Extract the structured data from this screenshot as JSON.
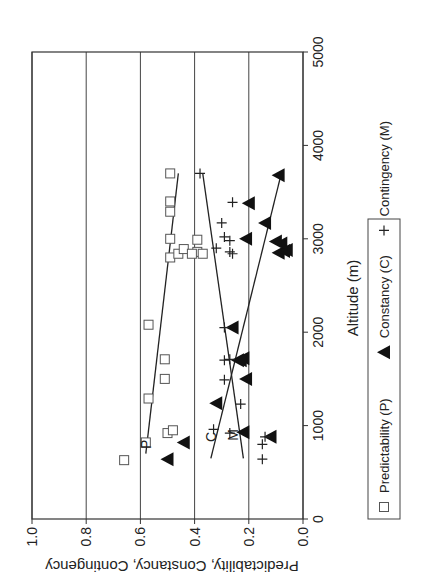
{
  "chart_data": {
    "type": "scatter",
    "orientation_note": "figure is rendered rotated 90 degrees counter-clockwise",
    "title": "",
    "xlabel": "Altitude (m)",
    "ylabel": "Predictability, Constancy, Contingency",
    "xlim": [
      0,
      5000
    ],
    "ylim": [
      0.0,
      1.0
    ],
    "x_ticks": [
      "0",
      "1000",
      "2000",
      "3000",
      "4000",
      "5000"
    ],
    "y_ticks": [
      "0.0",
      "0.2",
      "0.4",
      "0.6",
      "0.8",
      "1.0"
    ],
    "grid": "horizontal gridlines at each y tick",
    "legend": {
      "position": "below plot",
      "entries": [
        {
          "marker": "open-square",
          "label": "Predictability (P)"
        },
        {
          "marker": "filled-triangle",
          "label": "Constancy (C)"
        },
        {
          "marker": "plus",
          "label": "Contingency (M)"
        }
      ]
    },
    "annotations": [
      {
        "text": "P",
        "x": 800,
        "y": 0.58
      },
      {
        "text": "C",
        "x": 880,
        "y": 0.34
      },
      {
        "text": "M",
        "x": 900,
        "y": 0.26
      }
    ],
    "series": [
      {
        "name": "Predictability (P)",
        "marker": "open-square",
        "points": [
          [
            630,
            0.66
          ],
          [
            820,
            0.58
          ],
          [
            920,
            0.5
          ],
          [
            950,
            0.48
          ],
          [
            1290,
            0.57
          ],
          [
            1500,
            0.51
          ],
          [
            1710,
            0.51
          ],
          [
            2080,
            0.57
          ],
          [
            2800,
            0.49
          ],
          [
            2840,
            0.46
          ],
          [
            2860,
            0.39
          ],
          [
            2890,
            0.44
          ],
          [
            2840,
            0.41
          ],
          [
            2840,
            0.37
          ],
          [
            2990,
            0.39
          ],
          [
            3000,
            0.49
          ],
          [
            3290,
            0.49
          ],
          [
            3400,
            0.49
          ],
          [
            3700,
            0.49
          ]
        ],
        "trend": {
          "x": [
            700,
            3700
          ],
          "y": [
            0.58,
            0.46
          ]
        }
      },
      {
        "name": "Constancy (C)",
        "marker": "filled-triangle",
        "points": [
          [
            640,
            0.5
          ],
          [
            820,
            0.44
          ],
          [
            880,
            0.12
          ],
          [
            930,
            0.22
          ],
          [
            1240,
            0.32
          ],
          [
            1500,
            0.21
          ],
          [
            1700,
            0.24
          ],
          [
            1720,
            0.22
          ],
          [
            1700,
            0.23
          ],
          [
            2050,
            0.26
          ],
          [
            2850,
            0.09
          ],
          [
            2870,
            0.07
          ],
          [
            2880,
            0.06
          ],
          [
            2950,
            0.08
          ],
          [
            2970,
            0.1
          ],
          [
            3000,
            0.21
          ],
          [
            3170,
            0.14
          ],
          [
            3380,
            0.2
          ],
          [
            3680,
            0.09
          ]
        ],
        "trend": {
          "x": [
            650,
            3700
          ],
          "y": [
            0.34,
            0.08
          ]
        }
      },
      {
        "name": "Contingency (M)",
        "marker": "plus",
        "points": [
          [
            640,
            0.15
          ],
          [
            800,
            0.15
          ],
          [
            880,
            0.14
          ],
          [
            920,
            0.27
          ],
          [
            960,
            0.33
          ],
          [
            1230,
            0.23
          ],
          [
            1490,
            0.29
          ],
          [
            1700,
            0.29
          ],
          [
            1710,
            0.27
          ],
          [
            2050,
            0.29
          ],
          [
            2840,
            0.26
          ],
          [
            2860,
            0.27
          ],
          [
            2900,
            0.32
          ],
          [
            2980,
            0.27
          ],
          [
            3020,
            0.29
          ],
          [
            3170,
            0.3
          ],
          [
            3390,
            0.26
          ],
          [
            3700,
            0.38
          ]
        ],
        "trend": {
          "x": [
            650,
            3700
          ],
          "y": [
            0.22,
            0.37
          ]
        }
      }
    ]
  }
}
